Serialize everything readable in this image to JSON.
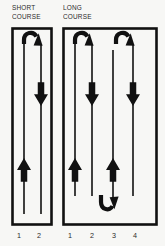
{
  "figure": {
    "kind": "swim-course-lane-diagram",
    "background_color": "#f7f7f5",
    "ink_color": "#111111"
  },
  "courses": [
    {
      "id": "short",
      "title_line1": "SHORT",
      "title_line2": "COURSE",
      "lane_count": 2,
      "lane_numbers": [
        "1",
        "2"
      ],
      "box": {
        "x": 12,
        "y": 28,
        "width": 40,
        "height": 197
      },
      "lane_lines": [
        {
          "lane": "1",
          "direction": "up",
          "arrowhead": "up",
          "arrow_y": 168
        },
        {
          "lane": "2",
          "direction": "down",
          "arrowhead": "down",
          "arrow_y": 96
        }
      ],
      "turns": [
        {
          "position": "top",
          "from_lane": "1",
          "to_lane": "2",
          "points": "down-right"
        }
      ]
    },
    {
      "id": "long",
      "title_line1": "LONG",
      "title_line2": "COURSE",
      "lane_count": 4,
      "lane_numbers": [
        "1",
        "2",
        "3",
        "4"
      ],
      "box": {
        "x": 63,
        "y": 28,
        "width": 94,
        "height": 197
      },
      "lane_lines": [
        {
          "lane": "1",
          "direction": "up",
          "arrowhead": "up",
          "arrow_y": 168
        },
        {
          "lane": "2",
          "direction": "down",
          "arrowhead": "down",
          "arrow_y": 96
        },
        {
          "lane": "3",
          "direction": "up",
          "arrowhead": "up",
          "arrow_y": 168
        },
        {
          "lane": "4",
          "direction": "down",
          "arrowhead": "down",
          "arrow_y": 96
        }
      ],
      "turns": [
        {
          "position": "top",
          "from_lane": "1",
          "to_lane": "2",
          "points": "down-right"
        },
        {
          "position": "bottom",
          "from_lane": "2",
          "to_lane": "3",
          "points": "up-right"
        },
        {
          "position": "top",
          "from_lane": "3",
          "to_lane": "4",
          "points": "down-right"
        }
      ]
    }
  ],
  "lane_number_labels": {
    "short": [
      {
        "text": "1",
        "x": 19,
        "y": 231
      },
      {
        "text": "2",
        "x": 39,
        "y": 231
      }
    ],
    "long": [
      {
        "text": "1",
        "x": 70,
        "y": 231
      },
      {
        "text": "2",
        "x": 92,
        "y": 231
      },
      {
        "text": "3",
        "x": 114,
        "y": 231
      },
      {
        "text": "4",
        "x": 135,
        "y": 231
      }
    ]
  }
}
